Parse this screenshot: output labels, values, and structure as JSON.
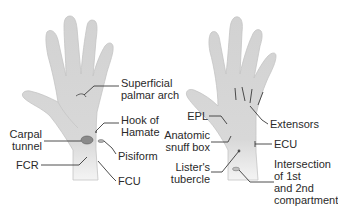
{
  "colors": {
    "background": "#ffffff",
    "skin": "#d4d4d4",
    "skin_outline": "#bdbdbd",
    "leader": "#3a3a3a",
    "marker": "#7a7a7a",
    "text": "#2a2a2a"
  },
  "palmar_view": {
    "labels": {
      "superficial_palmar_arch_1": "Superficial",
      "superficial_palmar_arch_2": "palmar arch",
      "hook_of_hamate_1": "Hook of",
      "hook_of_hamate_2": "Hamate",
      "carpal_tunnel_1": "Carpal",
      "carpal_tunnel_2": "tunnel",
      "pisiform": "Pisiform",
      "fcr": "FCR",
      "fcu": "FCU"
    }
  },
  "dorsal_view": {
    "labels": {
      "epl": "EPL",
      "extensors": "Extensors",
      "anatomic_snuff_box_1": "Anatomic",
      "anatomic_snuff_box_2": "snuff box",
      "ecu": "ECU",
      "listers_tubercle_1": "Lister's",
      "listers_tubercle_2": "tubercle",
      "intersection_1": "Intersection",
      "intersection_2": "of 1st",
      "intersection_3": "and 2nd",
      "intersection_4": "compartment"
    }
  }
}
